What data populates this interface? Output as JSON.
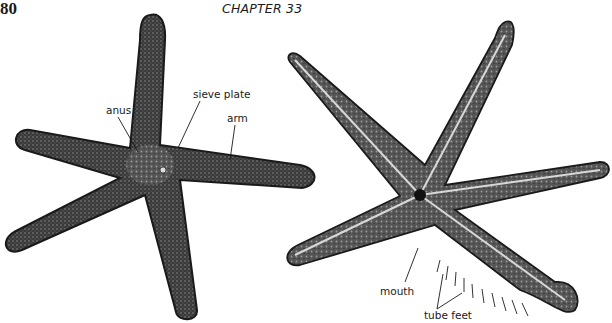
{
  "header": {
    "page_number": "80",
    "chapter": "CHAPTER 33"
  },
  "figure": {
    "left_specimen": {
      "description": "starfish, aboral (dorsal) view",
      "labels": {
        "anus": "anus",
        "sieve_plate": "sieve plate",
        "arm": "arm"
      }
    },
    "right_specimen": {
      "description": "starfish, oral (ventral) view",
      "labels": {
        "mouth": "mouth",
        "tube_feet": "tube feet"
      }
    },
    "colors": {
      "ink": "#1a1a1a",
      "body_dark": "#2b2b2b",
      "body_mid": "#6a6a6a",
      "groove_light": "#d8d8d8",
      "paper": "#ffffff"
    }
  }
}
